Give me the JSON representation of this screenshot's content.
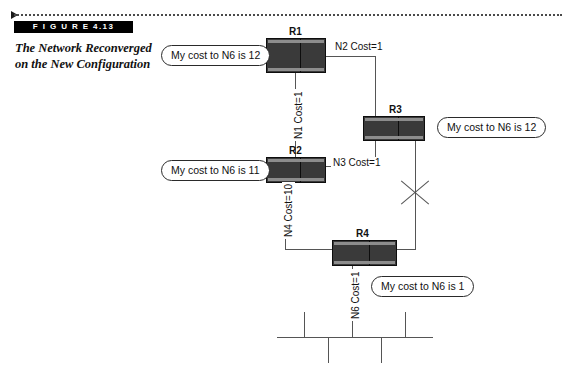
{
  "figure": {
    "arrow_icon": "triangle-right-icon",
    "label": "F I G U R E   4.13",
    "caption": "The Network Reconverged on the New Configuration"
  },
  "diagram": {
    "type": "network-topology",
    "routers": [
      {
        "id": "R1",
        "label": "R1"
      },
      {
        "id": "R2",
        "label": "R2"
      },
      {
        "id": "R3",
        "label": "R3"
      },
      {
        "id": "R4",
        "label": "R4"
      }
    ],
    "links": [
      {
        "id": "N1",
        "label": "N1 Cost=1",
        "network": "N1",
        "cost": 1,
        "orientation": "vertical",
        "between": [
          "R1",
          "R2"
        ]
      },
      {
        "id": "N2",
        "label": "N2 Cost=1",
        "network": "N2",
        "cost": 1,
        "orientation": "horizontal",
        "between": [
          "R1",
          "R3"
        ]
      },
      {
        "id": "N3",
        "label": "N3 Cost=1",
        "network": "N3",
        "cost": 1,
        "orientation": "horizontal",
        "between": [
          "R2",
          "R3"
        ]
      },
      {
        "id": "N4",
        "label": "N4 Cost=10",
        "network": "N4",
        "cost": 10,
        "orientation": "vertical",
        "between": [
          "R2",
          "R4"
        ]
      },
      {
        "id": "N6",
        "label": "N6 Cost=1",
        "network": "N6",
        "cost": 1,
        "orientation": "vertical",
        "between": [
          "R4",
          "bus"
        ]
      }
    ],
    "broken_link": {
      "icon": "x-cross-icon",
      "between": [
        "R3",
        "R4"
      ],
      "state": "down"
    },
    "callouts": [
      {
        "for": "R1",
        "text": "My cost to N6 is 12"
      },
      {
        "for": "R3",
        "text": "My cost to N6 is 12"
      },
      {
        "for": "R2",
        "text": "My cost to N6 is 11"
      },
      {
        "for": "R4",
        "text": "My cost to N6 is 1"
      }
    ],
    "bus": {
      "name": "N6",
      "stubs_up": 2,
      "stubs_down": 3
    }
  },
  "colors": {
    "router_fill": "#3a3a3a",
    "router_strip": "#8d8d8d",
    "wire": "#555555",
    "figure_bar": "#000000",
    "figure_bar_text": "#ffffff",
    "text": "#111111",
    "page_background": "#ffffff"
  }
}
